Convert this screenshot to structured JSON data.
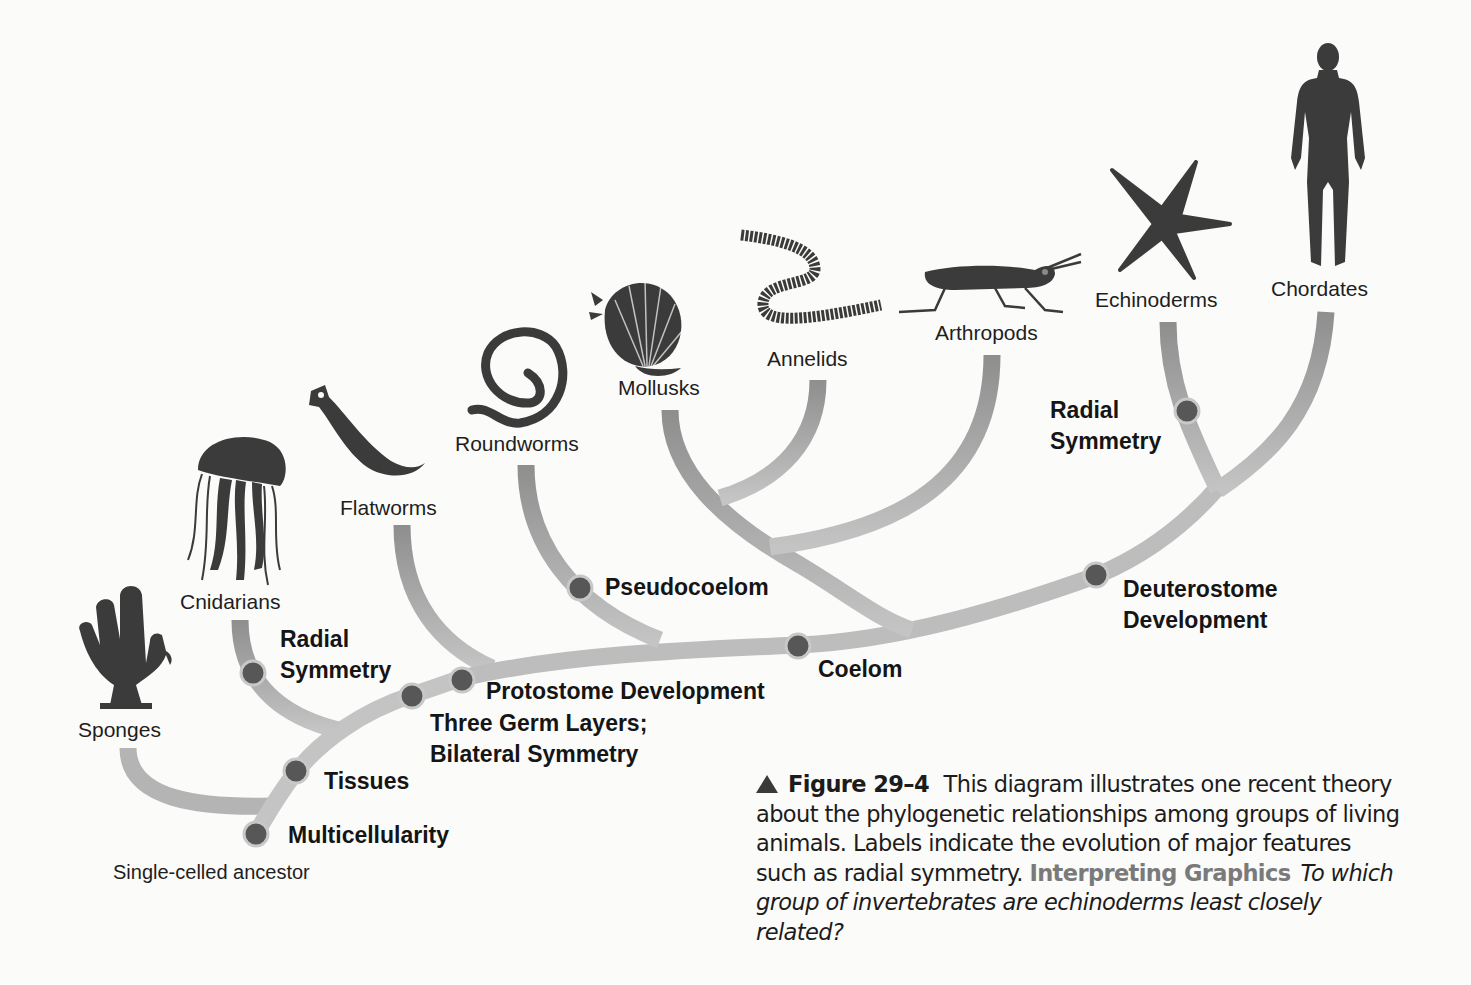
{
  "figure": {
    "number_label": "Figure 29–4",
    "caption_text": "This diagram illustrates one recent theory about the phylogenetic relationships among groups of living animals. Labels indicate the evolution of major features such as radial symmetry.",
    "interpreting_label": "Interpreting Graphics",
    "question": "To which group of invertebrates are echinoderms least closely related?"
  },
  "colors": {
    "branch": "#b9b9b9",
    "branch_dark": "#8f8f8f",
    "node": "#565656",
    "silhouette": "#3b3b3b",
    "interpreting_label": "#7a7a7a"
  },
  "root": {
    "label": "Single-celled ancestor"
  },
  "taxa": [
    {
      "id": "sponges",
      "label": "Sponges",
      "icon": "sponge-icon"
    },
    {
      "id": "cnidarians",
      "label": "Cnidarians",
      "icon": "jellyfish-icon"
    },
    {
      "id": "flatworms",
      "label": "Flatworms",
      "icon": "flatworm-icon"
    },
    {
      "id": "roundworms",
      "label": "Roundworms",
      "icon": "roundworm-icon"
    },
    {
      "id": "mollusks",
      "label": "Mollusks",
      "icon": "clam-icon"
    },
    {
      "id": "annelids",
      "label": "Annelids",
      "icon": "segmented-worm-icon"
    },
    {
      "id": "arthropods",
      "label": "Arthropods",
      "icon": "grasshopper-icon"
    },
    {
      "id": "echinoderms",
      "label": "Echinoderms",
      "icon": "starfish-icon"
    },
    {
      "id": "chordates",
      "label": "Chordates",
      "icon": "human-icon"
    }
  ],
  "traits": [
    {
      "id": "multicellularity",
      "lines": [
        "Multicellularity"
      ]
    },
    {
      "id": "tissues",
      "lines": [
        "Tissues"
      ]
    },
    {
      "id": "radial_symmetry_cnidarians",
      "lines": [
        "Radial",
        "Symmetry"
      ]
    },
    {
      "id": "three_germ_layers",
      "lines": [
        "Three Germ Layers;",
        "Bilateral Symmetry"
      ]
    },
    {
      "id": "protostome_development",
      "lines": [
        "Protostome Development"
      ]
    },
    {
      "id": "pseudocoelom",
      "lines": [
        "Pseudocoelom"
      ]
    },
    {
      "id": "coelom",
      "lines": [
        "Coelom"
      ]
    },
    {
      "id": "deuterostome_development",
      "lines": [
        "Deuterostome",
        "Development"
      ]
    },
    {
      "id": "radial_symmetry_echinoderms",
      "lines": [
        "Radial",
        "Symmetry"
      ]
    }
  ]
}
